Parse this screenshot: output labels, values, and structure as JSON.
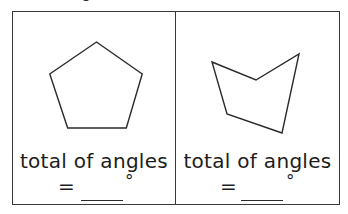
{
  "worksheet": {
    "clipped_glyph_above": "g",
    "panels": [
      {
        "shape": "regular-pentagon",
        "vertices": [
          [
            84,
            30
          ],
          [
            130,
            62
          ],
          [
            114,
            116
          ],
          [
            55,
            116
          ],
          [
            37,
            62
          ]
        ],
        "label_line1": "total of angles",
        "equals": "=",
        "blank": "",
        "unit": "°"
      },
      {
        "shape": "irregular-pentagon",
        "vertices": [
          [
            36,
            50
          ],
          [
            80,
            68
          ],
          [
            123,
            42
          ],
          [
            106,
            121
          ],
          [
            51,
            102
          ]
        ],
        "label_line1": "total of angles",
        "equals": "=",
        "blank": "",
        "unit": "°"
      }
    ]
  },
  "colors": {
    "border": "#3a3a3a",
    "text": "#1c1c1c",
    "shape_stroke": "#2a2a2a",
    "background": "#ffffff"
  }
}
